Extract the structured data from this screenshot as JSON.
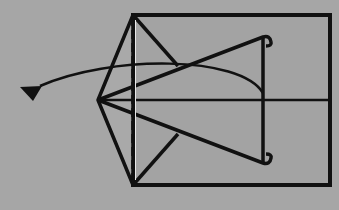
{
  "diagram": {
    "type": "origami-fold-step",
    "colors": {
      "background": "#a6a6a6",
      "paper": "#a3a3a3",
      "line": "#111111"
    },
    "elements": {
      "paper_rectangle": {
        "x": 133,
        "y": 15,
        "width": 197,
        "height": 170
      },
      "fold_line_dashed": {
        "x": 133,
        "y1": 15,
        "y2": 185,
        "style": "valley-fold"
      },
      "apex_point": {
        "x": 98,
        "y": 100
      },
      "center_line": {
        "x1": 98,
        "x2": 330,
        "y": 100
      },
      "inner_vertical_line": {
        "x": 263,
        "y1": 92,
        "y2": 165
      },
      "arrow": {
        "from": [
          263,
          92
        ],
        "to": [
          30,
          98
        ],
        "kind": "fold-direction"
      }
    }
  }
}
